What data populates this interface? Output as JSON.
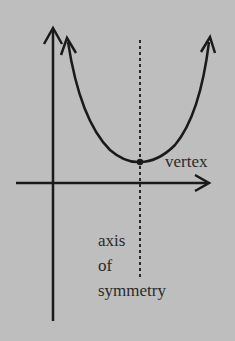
{
  "diagram": {
    "labels": {
      "vertex": "vertex",
      "axis_line1": "axis",
      "axis_line2": "of",
      "axis_line3": "symmetry"
    },
    "colors": {
      "background": "#bebebe",
      "ink": "#1a1a1a",
      "text": "#2a2a2a"
    }
  }
}
